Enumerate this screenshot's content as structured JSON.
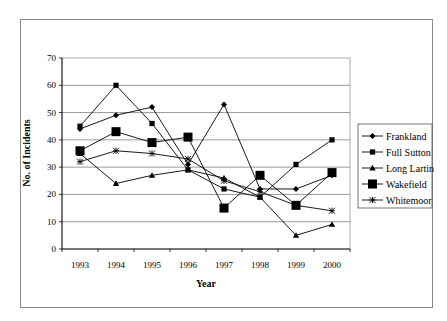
{
  "chart_data": {
    "type": "line",
    "title": "",
    "xlabel": "Year",
    "ylabel": "No. of Incidents",
    "categories": [
      "1993",
      "1994",
      "1995",
      "1996",
      "1997",
      "1998",
      "1999",
      "2000"
    ],
    "ylim": [
      0,
      70
    ],
    "yticks": [
      "0",
      "10",
      "20",
      "30",
      "40",
      "50",
      "60",
      "70"
    ],
    "grid": "horizontal",
    "legend_position": "right",
    "series": [
      {
        "name": "Frankland",
        "marker": "diamond",
        "values": [
          44,
          49,
          52,
          31,
          53,
          22,
          22,
          27
        ]
      },
      {
        "name": "Full Sutton",
        "marker": "square-small",
        "values": [
          45,
          60,
          46,
          29,
          22,
          19,
          31,
          40
        ]
      },
      {
        "name": "Long Lartin",
        "marker": "triangle",
        "values": [
          35,
          24,
          27,
          29,
          26,
          19,
          5,
          9
        ]
      },
      {
        "name": "Wakefield",
        "marker": "square-large",
        "values": [
          36,
          43,
          39,
          41,
          15,
          27,
          16,
          28
        ]
      },
      {
        "name": "Whitemoor",
        "marker": "star",
        "values": [
          32,
          36,
          35,
          33,
          25,
          21,
          16,
          14
        ]
      }
    ]
  },
  "colors": {
    "line": "#000000",
    "grid": "#7f7f7f",
    "frame": "#8a8a8a"
  }
}
